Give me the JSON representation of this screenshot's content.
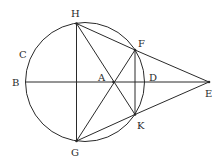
{
  "diagram": {
    "colors": {
      "stroke": "#2a2a2a",
      "background": "#ffffff"
    },
    "circle": {
      "cx": 85,
      "cy": 82,
      "r": 59.5
    },
    "points": {
      "H": {
        "x": 76.5,
        "y": 23.5,
        "label": "H",
        "lx": 71,
        "ly": 17
      },
      "F": {
        "x": 135,
        "y": 50,
        "label": "F",
        "lx": 138,
        "ly": 47
      },
      "K": {
        "x": 135,
        "y": 114.5,
        "label": "K",
        "lx": 137,
        "ly": 129
      },
      "G": {
        "x": 76.5,
        "y": 141,
        "label": "G",
        "lx": 71,
        "ly": 156
      },
      "E": {
        "x": 209,
        "y": 82,
        "label": "E",
        "lx": 205,
        "ly": 97
      },
      "A": {
        "x": 113.5,
        "y": 82,
        "label": "A",
        "lx": 98,
        "ly": 81
      },
      "B": {
        "x": 25.5,
        "y": 82,
        "label": "B",
        "lx": 12,
        "ly": 86
      },
      "C": {
        "x": 30,
        "y": 55,
        "label": "C",
        "lx": 19,
        "ly": 58
      },
      "D": {
        "x": 144.5,
        "y": 82,
        "label": "D",
        "lx": 149,
        "ly": 81
      }
    },
    "segments": [
      [
        "H",
        "G"
      ],
      [
        "B",
        "E"
      ],
      [
        "H",
        "F"
      ],
      [
        "F",
        "E"
      ],
      [
        "G",
        "K"
      ],
      [
        "K",
        "E"
      ],
      [
        "H",
        "K"
      ],
      [
        "G",
        "F"
      ],
      [
        "F",
        "K"
      ]
    ],
    "labels": [
      "H",
      "C",
      "B",
      "A",
      "D",
      "E",
      "F",
      "K",
      "G"
    ]
  }
}
